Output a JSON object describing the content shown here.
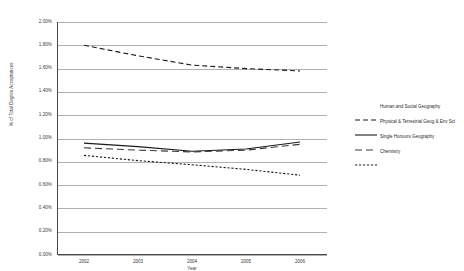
{
  "chart_data": {
    "type": "line",
    "title": "",
    "xlabel": "Year",
    "ylabel": "% of Total Degree Acceptances",
    "x": [
      2002,
      2003,
      2004,
      2005,
      2006
    ],
    "xtick_labels": [
      "2002",
      "2003",
      "2004",
      "2005",
      "2006"
    ],
    "ytick_labels": [
      "2.00%",
      "1.80%",
      "1.60%",
      "1.40%",
      "1.20%",
      "1.00%",
      "0.80%",
      "0.60%",
      "0.40%",
      "0.20%",
      "0.00%"
    ],
    "ytick_values": [
      2.0,
      1.8,
      1.6,
      1.4,
      1.2,
      1.0,
      0.8,
      0.6,
      0.4,
      0.2,
      0.0
    ],
    "ylim": [
      0.0,
      2.0
    ],
    "grid": true,
    "legend_position": "right",
    "series": [
      {
        "name": "Human and Social Geography",
        "style": "dashed",
        "color": "#1a1a1a",
        "values": [
          1.8,
          1.71,
          1.63,
          1.6,
          1.58
        ]
      },
      {
        "name": "Physical & Terrestrial Geog & Env Sci",
        "style": "solid",
        "color": "#1a1a1a",
        "values": [
          0.96,
          0.93,
          0.89,
          0.91,
          0.97
        ]
      },
      {
        "name": "Single Honours Geography",
        "style": "dashed-long",
        "color": "#3a3a3a",
        "values": [
          0.92,
          0.9,
          0.885,
          0.9,
          0.95
        ]
      },
      {
        "name": "Chemistry",
        "style": "dotted",
        "color": "#1a1a1a",
        "values": [
          0.855,
          0.81,
          0.775,
          0.735,
          0.685
        ]
      }
    ]
  },
  "legend": {
    "items": [
      {
        "label": "Human and Social Geography"
      },
      {
        "label": "Physical & Terrestrial Geog & Env Sci"
      },
      {
        "label": "Single Honours Geography"
      },
      {
        "label": "Chemistry"
      }
    ]
  }
}
